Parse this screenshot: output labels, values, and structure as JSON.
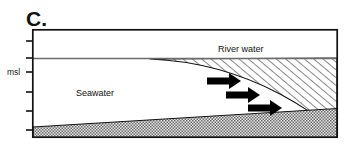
{
  "figure": {
    "panel_letter": "C.",
    "width": 347,
    "height": 152,
    "background_color": "#ffffff",
    "frame": {
      "x": 32,
      "y": 29,
      "width": 306,
      "height": 109,
      "stroke_color": "#111111",
      "stroke_width": 1.6
    }
  },
  "axis": {
    "name": "depth-axis",
    "label": "msl",
    "label_meaning": "mean sea level",
    "label_x": 8,
    "label_y": 75,
    "tick_color": "#111111",
    "tick_length": 7,
    "ticks": [
      {
        "y": 41,
        "labeled": false
      },
      {
        "y": 58,
        "labeled": false
      },
      {
        "y": 72,
        "labeled": true,
        "label": "msl"
      },
      {
        "y": 92,
        "labeled": false
      },
      {
        "y": 111,
        "labeled": false
      },
      {
        "y": 130,
        "labeled": false
      }
    ]
  },
  "water_surface": {
    "name": "water-surface-line",
    "y": 58,
    "x_start": 32,
    "x_end": 338,
    "color": "#6b6b6b",
    "stroke_width": 1.2
  },
  "layers": {
    "river_water": {
      "label": "River water",
      "label_x": 218,
      "label_y": 51,
      "fill_pattern": "diagonal-hatch",
      "hatch_color": "#111111",
      "hatch_spacing": 6,
      "hatch_angle_deg": 50,
      "outline_color": "#111111",
      "description": "Wedge of hatched fresher river water thinning to a tip toward the left (upstream-to-sea taper), riding above the seawater."
    },
    "seawater": {
      "label": "Seawater",
      "label_x": 77,
      "label_y": 95,
      "fill_pattern": "none",
      "fill_color": "#ffffff",
      "description": "Clear (unfilled) salt wedge occupying the lower-left of the channel."
    },
    "sediment_bottom": {
      "label": "",
      "fill_pattern": "stipple",
      "fill_color": "#d9d9d9",
      "stipple_color": "#555555",
      "outline_color": "#111111",
      "description": "Stippled sediment bed wedge rising from the lower-left to the right side of the channel."
    }
  },
  "flow_arrows": {
    "name": "flow-arrows",
    "color": "#000000",
    "direction": "right",
    "count": 3,
    "items": [
      {
        "id": "arrow-1",
        "x": 207,
        "y": 81,
        "length": 34,
        "shaft_thickness": 7,
        "head_length": 12,
        "head_half_width": 9
      },
      {
        "id": "arrow-2",
        "x": 226,
        "y": 95,
        "length": 34,
        "shaft_thickness": 7,
        "head_length": 12,
        "head_half_width": 9
      },
      {
        "id": "arrow-3",
        "x": 248,
        "y": 108,
        "length": 34,
        "shaft_thickness": 7,
        "head_length": 12,
        "head_half_width": 9
      }
    ]
  },
  "geometry": {
    "river_wedge_tip_x": 150,
    "river_wedge_base_x": 338,
    "interface_control_points": "tip at (150,59) curving down to (312,113) then to right wall",
    "sediment_left_y": 127,
    "sediment_right_y": 109,
    "sediment_bottom_y": 138
  }
}
